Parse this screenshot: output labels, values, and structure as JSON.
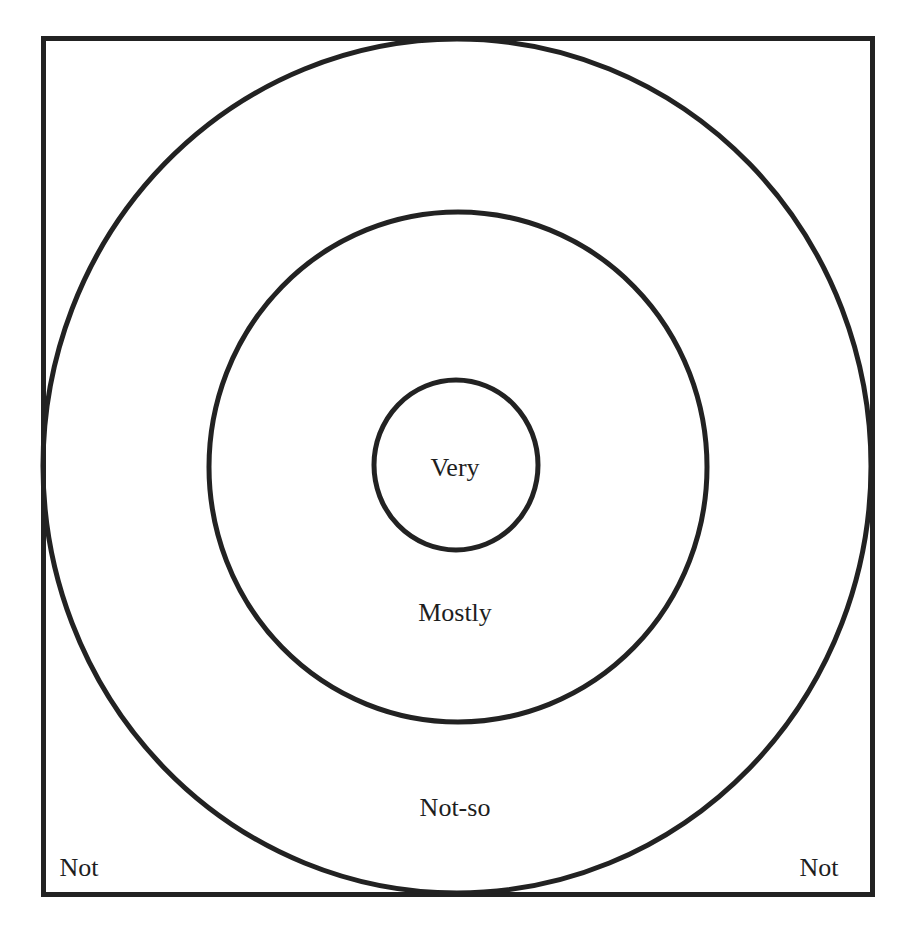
{
  "diagram": {
    "type": "concentric-target",
    "title": "",
    "stroke_color": "#222222",
    "background_color": "#ffffff",
    "frame": {
      "x": 41,
      "y": 36,
      "width": 834,
      "height": 861
    },
    "rings": [
      {
        "name": "outer",
        "cx": 457,
        "cy": 466,
        "rx": 414,
        "ry": 427
      },
      {
        "name": "middle",
        "cx": 458,
        "cy": 467,
        "rx": 249,
        "ry": 255
      },
      {
        "name": "inner",
        "cx": 456,
        "cy": 465,
        "rx": 82,
        "ry": 85
      }
    ],
    "labels": {
      "center": "Very",
      "middle_ring": "Mostly",
      "outer_ring": "Not-so",
      "corner_left": "Not",
      "corner_right": "Not"
    }
  }
}
